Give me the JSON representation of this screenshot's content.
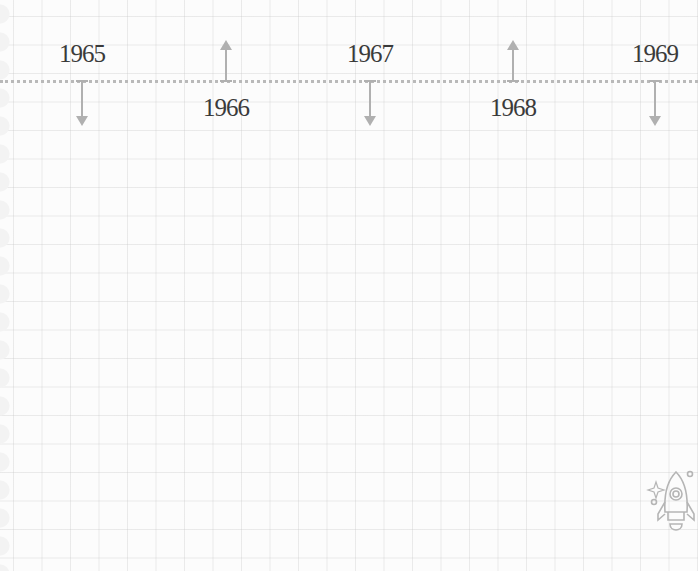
{
  "timeline": {
    "events": [
      {
        "year": "1965",
        "x": 82,
        "direction": "down",
        "label_position": "above"
      },
      {
        "year": "1966",
        "x": 226,
        "direction": "up",
        "label_position": "below"
      },
      {
        "year": "1967",
        "x": 370,
        "direction": "down",
        "label_position": "above"
      },
      {
        "year": "1968",
        "x": 513,
        "direction": "up",
        "label_position": "below"
      },
      {
        "year": "1969",
        "x": 655,
        "direction": "down",
        "label_position": "above"
      }
    ],
    "colors": {
      "axis": "#b9b9b9",
      "arrow": "#b0b0b0",
      "text": "#3a3a3a",
      "grid": "#e4e4e4"
    }
  },
  "decoration": {
    "icon": "rocket-icon"
  }
}
